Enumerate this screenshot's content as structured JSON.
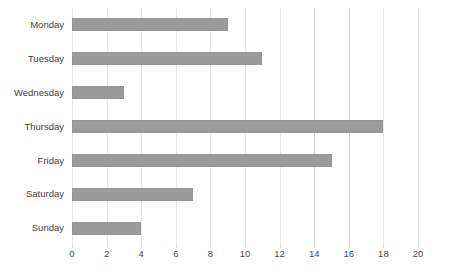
{
  "chart_data": {
    "type": "bar",
    "orientation": "horizontal",
    "title": "",
    "xlabel": "",
    "ylabel": "",
    "categories": [
      "Monday",
      "Tuesday",
      "Wednesday",
      "Thursday",
      "Friday",
      "Saturday",
      "Sunday"
    ],
    "values": [
      9,
      11,
      3,
      18,
      15,
      7,
      4
    ],
    "xlim": [
      0,
      20
    ],
    "xticks": [
      0,
      2,
      4,
      6,
      8,
      10,
      12,
      14,
      16,
      18,
      20
    ],
    "xtick_labels": [
      "0",
      "2",
      "4",
      "6",
      "8",
      "10",
      "12",
      "14",
      "16",
      "18",
      "20"
    ],
    "grid": true,
    "grid_axis": "x",
    "legend": null,
    "bar_color": "#9b9b9b",
    "gridline_color": "#e8e8e8",
    "major_gridline_color": "#d2d2d2",
    "major_gridlines": [
      14,
      16
    ],
    "label_color": "#404040",
    "background_color": "#ffffff"
  }
}
